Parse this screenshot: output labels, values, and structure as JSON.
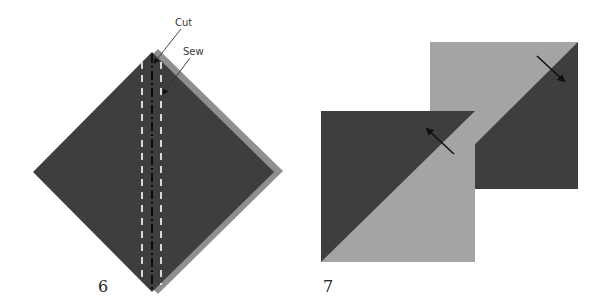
{
  "colors": {
    "dark_fabric": "#3e3e3e",
    "light_fabric": "#a4a4a4",
    "back_edge": "#8a8a8a",
    "sew_line": "#ffffff",
    "cut_line": "#0a0a0a",
    "arrow": "#111111"
  },
  "step6": {
    "number": "6",
    "labels": {
      "cut": "Cut",
      "sew": "Sew"
    }
  },
  "step7": {
    "number": "7"
  }
}
